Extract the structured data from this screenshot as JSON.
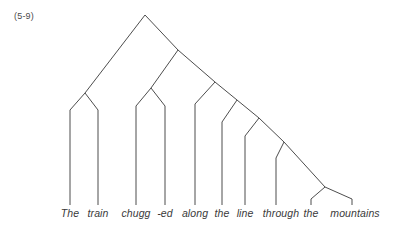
{
  "figure": {
    "example_number": "(5-9)",
    "caption_color": "#4a4a4a",
    "line_color": "#4d4d4d",
    "background_color": "#ffffff",
    "type": "syntax-tree",
    "sentence": "The train chugg -ed along the line through the mountains"
  },
  "leaves": [
    {
      "label": "The",
      "x": 70,
      "top": 110,
      "bottom": 205,
      "text_x": 70,
      "text_y": 207
    },
    {
      "label": "train",
      "x": 98,
      "top": 110,
      "bottom": 205,
      "text_x": 98,
      "text_y": 207
    },
    {
      "label": "chugg",
      "x": 136,
      "top": 106,
      "bottom": 205,
      "text_x": 136,
      "text_y": 207
    },
    {
      "label": "-ed",
      "x": 165,
      "top": 106,
      "bottom": 205,
      "text_x": 165,
      "text_y": 207
    },
    {
      "label": "along",
      "x": 195,
      "top": 104,
      "bottom": 205,
      "text_x": 195,
      "text_y": 207
    },
    {
      "label": "the",
      "x": 222,
      "top": 122,
      "bottom": 205,
      "text_x": 222,
      "text_y": 207
    },
    {
      "label": "line",
      "x": 245,
      "top": 136,
      "bottom": 205,
      "text_x": 245,
      "text_y": 207
    },
    {
      "label": "through",
      "x": 276,
      "top": 158,
      "bottom": 205,
      "text_x": 281,
      "text_y": 207
    },
    {
      "label": "the",
      "x": 311,
      "top": 199,
      "bottom": 205,
      "text_x": 311,
      "text_y": 207
    },
    {
      "label": "mountains",
      "x": 352,
      "top": 199,
      "bottom": 205,
      "text_x": 355,
      "text_y": 207
    }
  ],
  "branches": [
    {
      "name": "root-left-spine",
      "x1": 145,
      "y1": 15,
      "x2": 85,
      "y2": 93
    },
    {
      "name": "root-right-spine",
      "x1": 145,
      "y1": 15,
      "x2": 178,
      "y2": 50
    },
    {
      "name": "np1-left-leg",
      "x1": 85,
      "y1": 93,
      "x2": 70,
      "y2": 110
    },
    {
      "name": "np1-right-leg",
      "x1": 85,
      "y1": 93,
      "x2": 98,
      "y2": 110
    },
    {
      "name": "vp-left-spine",
      "x1": 178,
      "y1": 50,
      "x2": 151,
      "y2": 88
    },
    {
      "name": "vp-right-spine",
      "x1": 178,
      "y1": 50,
      "x2": 215,
      "y2": 82
    },
    {
      "name": "verb-left-leg",
      "x1": 151,
      "y1": 88,
      "x2": 136,
      "y2": 106
    },
    {
      "name": "verb-right-leg",
      "x1": 151,
      "y1": 88,
      "x2": 165,
      "y2": 106
    },
    {
      "name": "pp1-left-leg",
      "x1": 215,
      "y1": 82,
      "x2": 195,
      "y2": 104
    },
    {
      "name": "pp1-right-spine",
      "x1": 215,
      "y1": 82,
      "x2": 237,
      "y2": 100
    },
    {
      "name": "np2-left-leg",
      "x1": 237,
      "y1": 100,
      "x2": 222,
      "y2": 122
    },
    {
      "name": "np2-right-spine",
      "x1": 237,
      "y1": 100,
      "x2": 259,
      "y2": 118
    },
    {
      "name": "np2b-left-leg",
      "x1": 259,
      "y1": 118,
      "x2": 245,
      "y2": 136
    },
    {
      "name": "np2b-right-spine",
      "x1": 259,
      "y1": 118,
      "x2": 284,
      "y2": 142
    },
    {
      "name": "pp2-left-leg",
      "x1": 284,
      "y1": 142,
      "x2": 276,
      "y2": 158
    },
    {
      "name": "pp2-right-spine",
      "x1": 284,
      "y1": 142,
      "x2": 325,
      "y2": 187
    },
    {
      "name": "np3-left-leg",
      "x1": 325,
      "y1": 187,
      "x2": 311,
      "y2": 199
    },
    {
      "name": "np3-right-leg",
      "x1": 325,
      "y1": 187,
      "x2": 352,
      "y2": 199
    }
  ],
  "chart_data": {
    "type": "tree",
    "title": "(5-9)",
    "terminals": [
      "The",
      "train",
      "chugg",
      "-ed",
      "along",
      "the",
      "line",
      "through",
      "the",
      "mountains"
    ],
    "structure": "right-branching constituency tree with apex node and descending right spine",
    "node_count": 9,
    "leaf_count": 10
  }
}
